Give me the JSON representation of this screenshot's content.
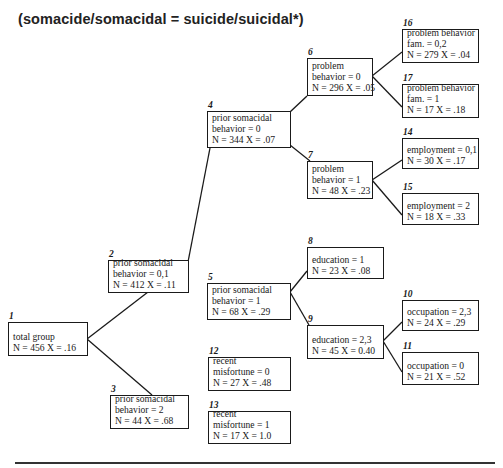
{
  "title": "(somacide/somacidal = suicide/suicidal*)",
  "nodes": {
    "n1": {
      "id": "1",
      "lines": [
        "total group",
        "N = 456  X = .16"
      ]
    },
    "n2": {
      "id": "2",
      "lines": [
        "prior somacidal",
        "behavior = 0,1",
        "N = 412  X = .11"
      ]
    },
    "n3": {
      "id": "3",
      "lines": [
        "prior somacidal",
        "behavior = 2",
        "N = 44  X = .68"
      ]
    },
    "n4": {
      "id": "4",
      "lines": [
        "prior somacidal",
        "behavior = 0",
        "N = 344  X = .07"
      ]
    },
    "n5": {
      "id": "5",
      "lines": [
        "prior somacidal",
        "behavior = 1",
        "N = 68  X = .29"
      ]
    },
    "n6": {
      "id": "6",
      "lines": [
        "problem",
        "behavior = 0",
        "N = 296  X = .05"
      ]
    },
    "n7": {
      "id": "7",
      "lines": [
        "problem",
        "behavior = 1",
        "N = 48  X = .23"
      ]
    },
    "n8": {
      "id": "8",
      "lines": [
        "education = 1",
        "N = 23  X = .08"
      ]
    },
    "n9": {
      "id": "9",
      "lines": [
        "education = 2,3",
        "N = 45  X = 0.40"
      ]
    },
    "n10": {
      "id": "10",
      "lines": [
        "occupation = 2,3",
        "N = 24  X = .29"
      ]
    },
    "n11": {
      "id": "11",
      "lines": [
        "occupation = 0",
        "N = 21  X = .52"
      ]
    },
    "n12": {
      "id": "12",
      "lines": [
        "recent",
        "misfortune = 0",
        "N = 27  X = .48"
      ]
    },
    "n13": {
      "id": "13",
      "lines": [
        "recent",
        "misfortune = 1",
        "N = 17  X = 1.0"
      ]
    },
    "n14": {
      "id": "14",
      "lines": [
        "employment = 0,1",
        "N = 30  X = .17"
      ]
    },
    "n15": {
      "id": "15",
      "lines": [
        "employment = 2",
        "N = 18  X = .33"
      ]
    },
    "n16": {
      "id": "16",
      "lines": [
        "problem behavior",
        "fam. = 0,2",
        "N = 279  X = .04"
      ]
    },
    "n17": {
      "id": "17",
      "lines": [
        "problem behavior",
        "fam. = 1",
        "N = 17  X = .18"
      ]
    }
  },
  "edges": [
    [
      "1",
      "2"
    ],
    [
      "1",
      "3"
    ],
    [
      "2",
      "4"
    ],
    [
      "2",
      "5"
    ],
    [
      "4",
      "6"
    ],
    [
      "4",
      "7"
    ],
    [
      "6",
      "16"
    ],
    [
      "6",
      "17"
    ],
    [
      "7",
      "14"
    ],
    [
      "7",
      "15"
    ],
    [
      "5",
      "8"
    ],
    [
      "5",
      "9"
    ],
    [
      "9",
      "10"
    ],
    [
      "9",
      "11"
    ]
  ]
}
